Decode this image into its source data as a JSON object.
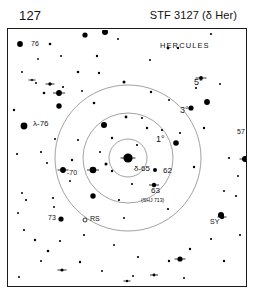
{
  "header": {
    "chart_number": "127",
    "title": "STF 3127 (δ Her)"
  },
  "field": {
    "constellation_label": "HERCULES",
    "center_star_label": "δ-65",
    "rings": [
      {
        "label": "1°",
        "radius_px": 19,
        "label_x": 148,
        "label_y": 112
      },
      {
        "label": "3°",
        "radius_px": 45,
        "label_x": 172,
        "label_y": 83
      },
      {
        "label": "5°",
        "radius_px": 73,
        "label_x": 186,
        "label_y": 55
      }
    ],
    "center_x": 120,
    "center_y": 128,
    "labels": [
      {
        "id": "star-76",
        "text": "76",
        "x": 23,
        "y": 16
      },
      {
        "id": "star-lambda-76",
        "text": "λ-76",
        "x": 25,
        "y": 96
      },
      {
        "id": "star-70",
        "text": "-70",
        "x": 59,
        "y": 145
      },
      {
        "id": "star-73",
        "text": "73",
        "x": 40,
        "y": 190
      },
      {
        "id": "star-rs",
        "text": "RS",
        "x": 82,
        "y": 191
      },
      {
        "id": "star-62",
        "text": "62",
        "x": 155,
        "y": 143
      },
      {
        "id": "star-63",
        "text": "63",
        "x": 143,
        "y": 163
      },
      {
        "id": "star-63-sub",
        "text": "(SHJ 713)",
        "x": 133,
        "y": 172
      },
      {
        "id": "star-57",
        "text": "57",
        "x": 229,
        "y": 104
      },
      {
        "id": "star-sy",
        "text": "SY",
        "x": 202,
        "y": 194
      }
    ],
    "stars": [
      {
        "x": 12,
        "y": 14,
        "r": 2.9
      },
      {
        "x": 14,
        "y": 42,
        "r": 1.0
      },
      {
        "x": 30,
        "y": 29,
        "r": 0.9
      },
      {
        "x": 42,
        "y": 14,
        "r": 1.3
      },
      {
        "x": 53,
        "y": 26,
        "r": 1.0
      },
      {
        "x": 28,
        "y": 53,
        "r": 1.0
      },
      {
        "x": 36,
        "y": 63,
        "r": 1.3
      },
      {
        "x": 55,
        "y": 57,
        "r": 1.1
      },
      {
        "x": 70,
        "y": 42,
        "r": 1.3
      },
      {
        "x": 74,
        "y": 61,
        "r": 1.0
      },
      {
        "x": 89,
        "y": 26,
        "r": 1.2
      },
      {
        "x": 77,
        "y": 5,
        "r": 2.6
      },
      {
        "x": 97,
        "y": 2,
        "r": 3.0
      },
      {
        "x": 110,
        "y": 9,
        "r": 1.0
      },
      {
        "x": 91,
        "y": 43,
        "r": 1.2
      },
      {
        "x": 86,
        "y": 73,
        "r": 1.3
      },
      {
        "x": 51,
        "y": 76,
        "r": 2.7
      },
      {
        "x": 6,
        "y": 80,
        "r": 1.2
      },
      {
        "x": 16,
        "y": 96,
        "r": 3.4
      },
      {
        "x": 9,
        "y": 124,
        "r": 1.1
      },
      {
        "x": 33,
        "y": 122,
        "r": 1.1
      },
      {
        "x": 47,
        "y": 109,
        "r": 1.0
      },
      {
        "x": 70,
        "y": 110,
        "r": 1.1
      },
      {
        "x": 92,
        "y": 122,
        "r": 1.0
      },
      {
        "x": 96,
        "y": 95,
        "r": 3.0
      },
      {
        "x": 104,
        "y": 108,
        "r": 1.2
      },
      {
        "x": 98,
        "y": 134,
        "r": 1.5
      },
      {
        "x": 118,
        "y": 87,
        "r": 1.4
      },
      {
        "x": 134,
        "y": 88,
        "r": 1.1
      },
      {
        "x": 116,
        "y": 52,
        "r": 1.5
      },
      {
        "x": 143,
        "y": 62,
        "r": 1.2
      },
      {
        "x": 129,
        "y": 115,
        "r": 1.1
      },
      {
        "x": 139,
        "y": 98,
        "r": 1.2
      },
      {
        "x": 154,
        "y": 100,
        "r": 1.1
      },
      {
        "x": 161,
        "y": 70,
        "r": 1.0
      },
      {
        "x": 172,
        "y": 103,
        "r": 1.1
      },
      {
        "x": 188,
        "y": 58,
        "r": 1.1
      },
      {
        "x": 183,
        "y": 78,
        "r": 2.6
      },
      {
        "x": 199,
        "y": 72,
        "r": 2.9
      },
      {
        "x": 212,
        "y": 54,
        "r": 1.0
      },
      {
        "x": 196,
        "y": 98,
        "r": 1.2
      },
      {
        "x": 203,
        "y": 4,
        "r": 1.1
      },
      {
        "x": 160,
        "y": 18,
        "r": 1.4
      },
      {
        "x": 170,
        "y": 18,
        "r": 1.2
      },
      {
        "x": 142,
        "y": 30,
        "r": 1.0
      },
      {
        "x": 168,
        "y": 113,
        "r": 2.8
      },
      {
        "x": 147,
        "y": 140,
        "r": 2.0
      },
      {
        "x": 124,
        "y": 154,
        "r": 1.1
      },
      {
        "x": 111,
        "y": 170,
        "r": 1.1
      },
      {
        "x": 160,
        "y": 179,
        "r": 1.1
      },
      {
        "x": 85,
        "y": 166,
        "r": 2.7
      },
      {
        "x": 62,
        "y": 151,
        "r": 1.0
      },
      {
        "x": 104,
        "y": 141,
        "r": 1.2
      },
      {
        "x": 116,
        "y": 188,
        "r": 1.0
      },
      {
        "x": 53,
        "y": 189,
        "r": 2.6
      },
      {
        "x": 16,
        "y": 200,
        "r": 1.1
      },
      {
        "x": 27,
        "y": 210,
        "r": 1.2
      },
      {
        "x": 10,
        "y": 183,
        "r": 1.0
      },
      {
        "x": 14,
        "y": 163,
        "r": 1.0
      },
      {
        "x": 18,
        "y": 170,
        "r": 1.1
      },
      {
        "x": 45,
        "y": 168,
        "r": 1.1
      },
      {
        "x": 46,
        "y": 177,
        "r": 1.0
      },
      {
        "x": 33,
        "y": 231,
        "r": 1.0
      },
      {
        "x": 52,
        "y": 211,
        "r": 1.1
      },
      {
        "x": 40,
        "y": 221,
        "r": 1.3
      },
      {
        "x": 72,
        "y": 232,
        "r": 1.2
      },
      {
        "x": 76,
        "y": 205,
        "r": 1.1
      },
      {
        "x": 11,
        "y": 247,
        "r": 1.0
      },
      {
        "x": 94,
        "y": 241,
        "r": 1.0
      },
      {
        "x": 106,
        "y": 215,
        "r": 1.0
      },
      {
        "x": 130,
        "y": 227,
        "r": 1.1
      },
      {
        "x": 161,
        "y": 231,
        "r": 1.2
      },
      {
        "x": 182,
        "y": 219,
        "r": 1.2
      },
      {
        "x": 203,
        "y": 209,
        "r": 1.1
      },
      {
        "x": 125,
        "y": 246,
        "r": 1.0
      },
      {
        "x": 176,
        "y": 248,
        "r": 1.0
      },
      {
        "x": 216,
        "y": 231,
        "r": 1.2
      },
      {
        "x": 213,
        "y": 185,
        "r": 3.0
      },
      {
        "x": 216,
        "y": 161,
        "r": 1.0
      },
      {
        "x": 228,
        "y": 166,
        "r": 1.1
      },
      {
        "x": 232,
        "y": 205,
        "r": 1.1
      },
      {
        "x": 186,
        "y": 137,
        "r": 1.2
      },
      {
        "x": 221,
        "y": 128,
        "r": 1.1
      },
      {
        "x": 230,
        "y": 146,
        "r": 1.0
      },
      {
        "x": 58,
        "y": 259,
        "r": 1.1
      },
      {
        "x": 86,
        "y": 267,
        "r": 1.1
      },
      {
        "x": 164,
        "y": 259,
        "r": 1.0
      },
      {
        "x": 39,
        "y": 133,
        "r": 1.0
      },
      {
        "x": 64,
        "y": 130,
        "r": 1.2
      }
    ],
    "double_stars": [
      {
        "x": 120,
        "y": 128,
        "r": 4.6,
        "tick": 7.5
      },
      {
        "x": 55,
        "y": 140,
        "r": 2.9,
        "tick": 5.5
      },
      {
        "x": 85,
        "y": 140,
        "r": 3.3,
        "tick": 6.0
      },
      {
        "x": 51,
        "y": 63,
        "r": 2.9,
        "tick": 6.0
      },
      {
        "x": 42,
        "y": 54,
        "r": 1.7,
        "tick": 4.5
      },
      {
        "x": 24,
        "y": 50,
        "r": 1.1,
        "tick": 3.5
      },
      {
        "x": 193,
        "y": 48,
        "r": 1.9,
        "tick": 5.5
      },
      {
        "x": 237,
        "y": 129,
        "r": 3.0,
        "tick": 5.5
      },
      {
        "x": 146,
        "y": 155,
        "r": 2.2,
        "tick": 5.0
      },
      {
        "x": 214,
        "y": 187,
        "r": 2.2,
        "tick": 4.5
      },
      {
        "x": 172,
        "y": 229,
        "r": 2.6,
        "tick": 5.5
      },
      {
        "x": 54,
        "y": 240,
        "r": 1.6,
        "tick": 4.5
      },
      {
        "x": 146,
        "y": 245,
        "r": 1.4,
        "tick": 4.0
      },
      {
        "x": 119,
        "y": 251,
        "r": 1.2,
        "tick": 3.5
      }
    ],
    "variable_stars": [
      {
        "x": 77,
        "y": 190,
        "r": 2.0
      }
    ]
  }
}
